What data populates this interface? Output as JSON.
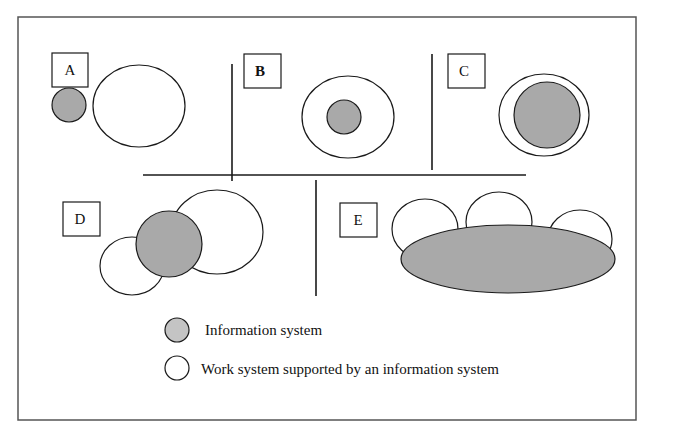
{
  "diagram": {
    "colors": {
      "information_system_fill": "#a9a9a9",
      "work_system_fill": "#ffffff",
      "stroke": "#1a1a1a",
      "frame": "#555555"
    },
    "panels": [
      {
        "id": "A",
        "label": "A",
        "bold": false,
        "description": "Information system separate from work system"
      },
      {
        "id": "B",
        "label": "B",
        "bold": true,
        "description": "Small information system inside work system"
      },
      {
        "id": "C",
        "label": "C",
        "bold": false,
        "description": "Information system almost fills work system"
      },
      {
        "id": "D",
        "label": "D",
        "bold": false,
        "description": "Information system overlaps two work systems"
      },
      {
        "id": "E",
        "label": "E",
        "bold": false,
        "description": "Large information system supports three work systems"
      }
    ],
    "legend": {
      "items": [
        {
          "symbol": "gray-circle",
          "label": "Information system"
        },
        {
          "symbol": "white-circle",
          "label": "Work system supported by an information system"
        }
      ]
    }
  }
}
